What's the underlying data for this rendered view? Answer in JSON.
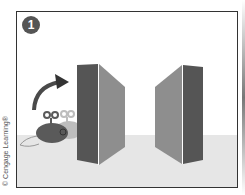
{
  "figure": {
    "step_number": "1",
    "copyright": "© Cengage Learning®",
    "colors": {
      "border": "#333333",
      "floor": "#e6e6e6",
      "panel_dark": "#555555",
      "panel_light": "#8e8e8e",
      "badge": "#555555",
      "mouse_dark": "#5a5a5a",
      "mouse_light": "#bdbdbd",
      "arrow": "#4a4a4a"
    },
    "elements": [
      "wind-up toy mouse",
      "curved arrow",
      "left panel",
      "right panel"
    ]
  }
}
